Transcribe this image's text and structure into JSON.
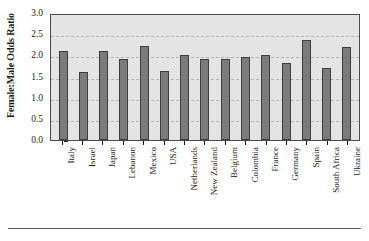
{
  "chart_data": {
    "type": "bar",
    "title": "",
    "xlabel": "",
    "ylabel": "Female:Male Odds Ratio",
    "ylim": [
      0.0,
      3.0
    ],
    "yticks": [
      "0.0",
      "0.5",
      "1.0",
      "1.5",
      "2.0",
      "2.5",
      "3.0"
    ],
    "ytick_values": [
      0.0,
      0.5,
      1.0,
      1.5,
      2.0,
      2.5,
      3.0
    ],
    "grid": true,
    "legend": "none",
    "categories": [
      "Italy",
      "Israel",
      "Japan",
      "Lebanon",
      "Mexico",
      "USA",
      "Netherlands",
      "New Zealand",
      "Belgium",
      "Colombia",
      "France",
      "Germany",
      "Spain",
      "South Africa",
      "Ukraine"
    ],
    "values": [
      2.1,
      1.6,
      2.1,
      1.91,
      2.21,
      1.62,
      2.0,
      1.91,
      1.91,
      1.95,
      2.02,
      1.82,
      2.37,
      1.7,
      2.2
    ],
    "bar_color": "#7b7b7b",
    "bar_edge_color": "#3d3d3d",
    "plot_background": "#e4e4e4",
    "gridline_color": "#b3b3b3",
    "axis_color": "#4a4a4a"
  }
}
